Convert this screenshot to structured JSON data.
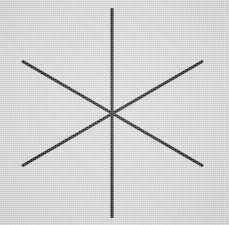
{
  "canvas": {
    "width": 229,
    "height": 225,
    "background_color": "#d7d7d7",
    "texture": "scanned-paper-noise"
  },
  "figure": {
    "name": "six-spoke-asterisk",
    "stroke_color": "#171717",
    "stroke_width": 3,
    "line_cap": "butt",
    "center": {
      "x": 112,
      "y": 114
    },
    "spoke_count": 6,
    "line_count": 3
  },
  "lines": [
    {
      "id": "vertical-line",
      "label": "vertical",
      "x1": 112,
      "y1": 8,
      "x2": 112,
      "y2": 218,
      "angle_deg": 90,
      "stroke_width": 3,
      "color": "#171717"
    },
    {
      "id": "diagonal-down-right-line",
      "label": "diagonal-down-right",
      "x1": 22,
      "y1": 61,
      "x2": 203,
      "y2": 166,
      "angle_deg": -30,
      "stroke_width": 3,
      "color": "#171717"
    },
    {
      "id": "diagonal-up-right-line",
      "label": "diagonal-up-right",
      "x1": 22,
      "y1": 166,
      "x2": 203,
      "y2": 61,
      "angle_deg": 30,
      "stroke_width": 3,
      "color": "#171717"
    }
  ],
  "endpoints": [
    {
      "id": "endpoint-top",
      "x": 112,
      "y": 8
    },
    {
      "id": "endpoint-bottom",
      "x": 112,
      "y": 218
    },
    {
      "id": "endpoint-upper-left",
      "x": 22,
      "y": 61
    },
    {
      "id": "endpoint-upper-right",
      "x": 203,
      "y": 61
    },
    {
      "id": "endpoint-lower-left",
      "x": 22,
      "y": 166
    },
    {
      "id": "endpoint-lower-right",
      "x": 203,
      "y": 166
    }
  ]
}
